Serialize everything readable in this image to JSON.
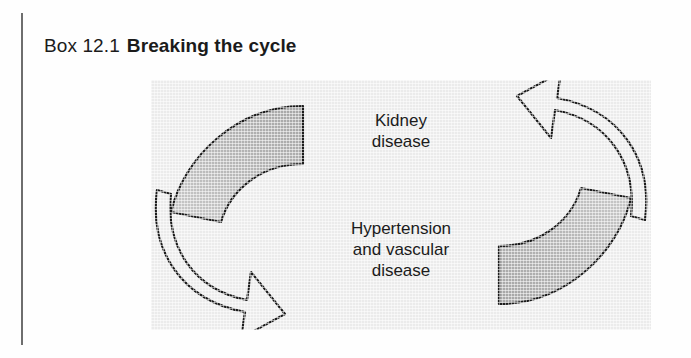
{
  "page": {
    "background_color": "#fefefe",
    "margin_rule_color": "#6e6e6e"
  },
  "caption": {
    "box_number": "Box 12.1",
    "box_title": "Breaking the cycle"
  },
  "figure": {
    "panel_color": "#ebebeb",
    "arrow_fill_shaded": "#b4b4b4",
    "arrow_fill_plain": "#ebebeb",
    "arrow_outline": "#1b1b1b",
    "labels": {
      "top": {
        "line1": "Kidney",
        "line2": "disease"
      },
      "bottom": {
        "line1": "Hypertension",
        "line2": "and vascular",
        "line3": "disease"
      }
    },
    "arrows": [
      {
        "name": "left-arrow",
        "direction": "downward-clockwise",
        "points_to": "Hypertension and vascular disease"
      },
      {
        "name": "right-arrow",
        "direction": "upward-clockwise",
        "points_to": "Kidney disease"
      }
    ]
  }
}
